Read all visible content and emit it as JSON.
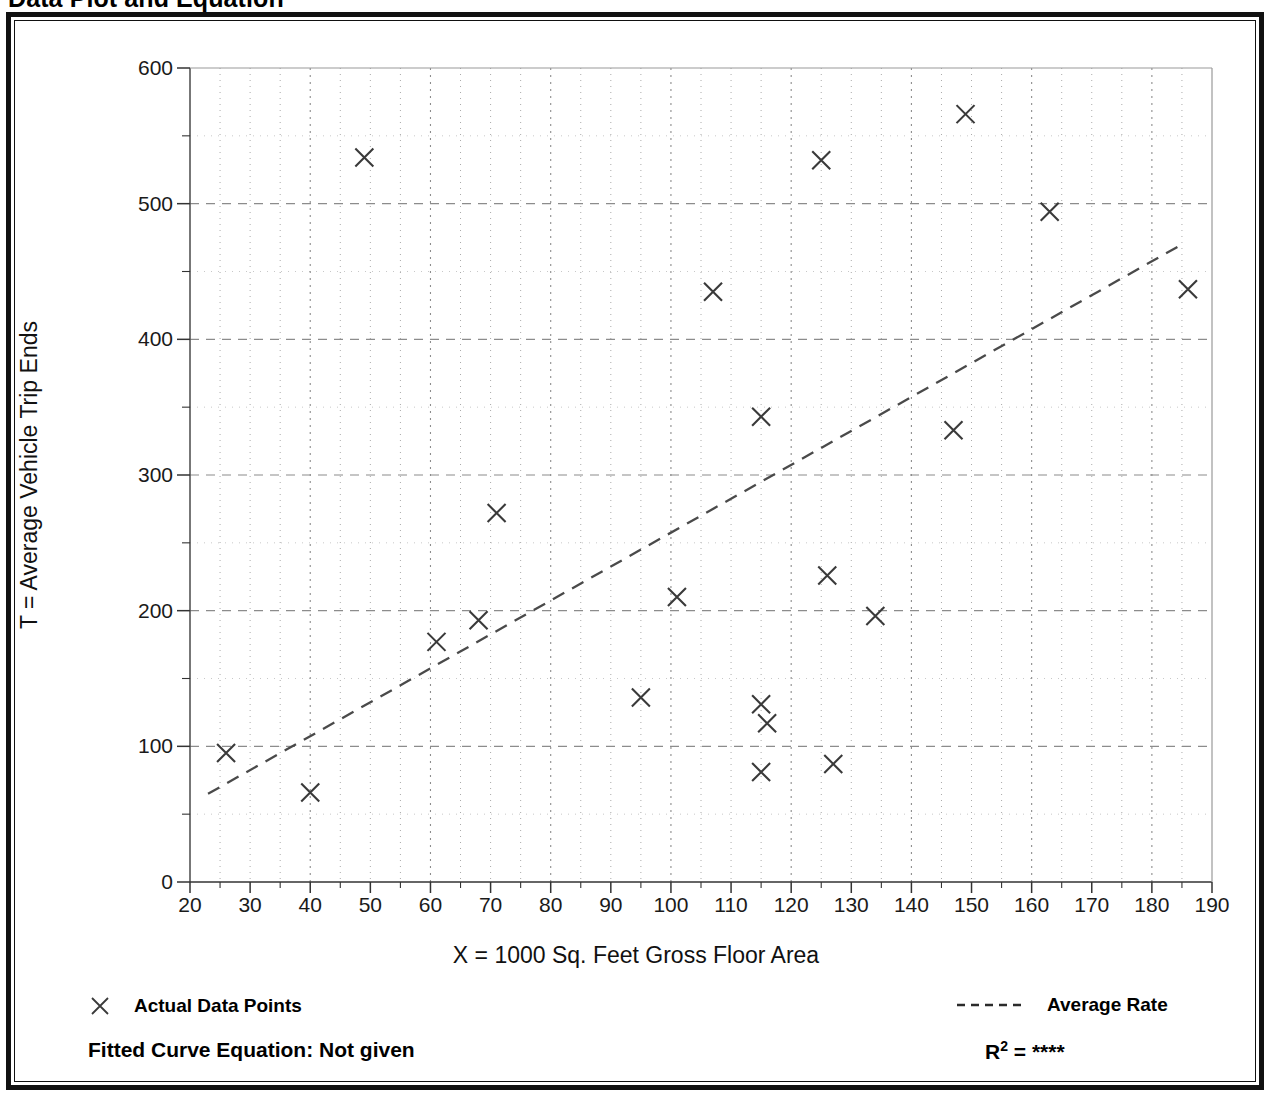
{
  "page": {
    "title": "Data Plot and Equation"
  },
  "legend": {
    "data_points_label": "Actual Data Points",
    "average_rate_label": "Average Rate",
    "data_points_marker": "x-marker-icon",
    "average_rate_marker": "dashed-line-icon"
  },
  "footer": {
    "equation_label": "Fitted Curve Equation:  Not given",
    "rsq_prefix": "R",
    "rsq_exponent": "2",
    "rsq_equals": " = ",
    "rsq_value": "****"
  },
  "chart_data": {
    "type": "scatter",
    "title": "Data Plot and Equation",
    "xlabel": "X = 1000 Sq. Feet Gross Floor Area",
    "ylabel": "T = Average Vehicle Trip Ends",
    "xlim": [
      20,
      190
    ],
    "ylim": [
      0,
      600
    ],
    "xticks": [
      20,
      30,
      40,
      50,
      60,
      70,
      80,
      90,
      100,
      110,
      120,
      130,
      140,
      150,
      160,
      170,
      180,
      190
    ],
    "yticks": [
      0,
      100,
      200,
      300,
      400,
      500,
      600
    ],
    "x_minor_step": 5,
    "y_minor_step": 50,
    "x_major_grid_step": 20,
    "y_major_grid_step": 100,
    "grid": true,
    "legend_position": "below-axes",
    "marker": "x",
    "marker_color": "#3a3a3a",
    "series": [
      {
        "name": "Actual Data Points",
        "type": "scatter",
        "points": [
          [
            26,
            95
          ],
          [
            40,
            66
          ],
          [
            49,
            534
          ],
          [
            61,
            177
          ],
          [
            68,
            193
          ],
          [
            71,
            272
          ],
          [
            95,
            136
          ],
          [
            101,
            210
          ],
          [
            107,
            435
          ],
          [
            115,
            343
          ],
          [
            115,
            131
          ],
          [
            116,
            117
          ],
          [
            115,
            81
          ],
          [
            125,
            532
          ],
          [
            126,
            226
          ],
          [
            127,
            87
          ],
          [
            134,
            196
          ],
          [
            147,
            333
          ],
          [
            149,
            566
          ],
          [
            163,
            494
          ],
          [
            186,
            437
          ]
        ]
      },
      {
        "name": "Average Rate",
        "type": "line",
        "style": "dashed",
        "color": "#4a4a4a",
        "endpoints": [
          [
            23,
            65
          ],
          [
            185,
            470
          ]
        ]
      }
    ]
  }
}
